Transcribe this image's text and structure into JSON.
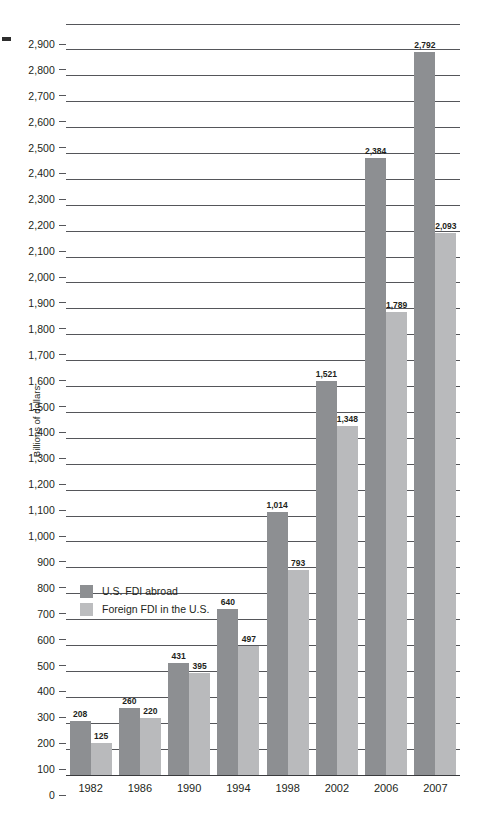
{
  "chart_data": {
    "type": "bar",
    "title": "",
    "xlabel": "",
    "ylabel": "Billions of dollars",
    "ylim": [
      0,
      2900
    ],
    "ytick_step": 100,
    "grid": true,
    "legend_position": "inside-left",
    "categories": [
      "1982",
      "1986",
      "1990",
      "1994",
      "1998",
      "2002",
      "2006",
      "2007"
    ],
    "ytick_labels": [
      "2,900",
      "2,800",
      "2,700",
      "2,600",
      "2,500",
      "2,400",
      "2,300",
      "2,200",
      "2,100",
      "2,000",
      "1,900",
      "1,800",
      "1,700",
      "1,600",
      "1,500",
      "1,400",
      "1,300",
      "1,200",
      "1,100",
      "1,000",
      "900",
      "800",
      "700",
      "600",
      "500",
      "400",
      "300",
      "200",
      "100",
      "0"
    ],
    "ytick_values": [
      2900,
      2800,
      2700,
      2600,
      2500,
      2400,
      2300,
      2200,
      2100,
      2000,
      1900,
      1800,
      1700,
      1600,
      1500,
      1400,
      1300,
      1200,
      1100,
      1000,
      900,
      800,
      700,
      600,
      500,
      400,
      300,
      200,
      100,
      0
    ],
    "series": [
      {
        "name": "U.S. FDI abroad",
        "color": "#8d8f92",
        "values": [
          208,
          260,
          431,
          640,
          1014,
          1521,
          2384,
          2792
        ],
        "labels": [
          "208",
          "260",
          "431",
          "640",
          "1,014",
          "1,521",
          "2,384",
          "2,792"
        ]
      },
      {
        "name": "Foreign FDI in the U.S.",
        "color": "#b9babc",
        "values": [
          125,
          220,
          395,
          497,
          793,
          1348,
          1789,
          2093
        ],
        "labels": [
          "125",
          "220",
          "395",
          "497",
          "793",
          "1,348",
          "1,789",
          "2,093"
        ]
      }
    ]
  },
  "legend": {
    "items": [
      {
        "label": "U.S. FDI abroad",
        "color": "#8d8f92"
      },
      {
        "label": "Foreign FDI in the U.S.",
        "color": "#bcbdbf"
      }
    ]
  },
  "axis": {
    "y_title": "Billions of dollars"
  }
}
